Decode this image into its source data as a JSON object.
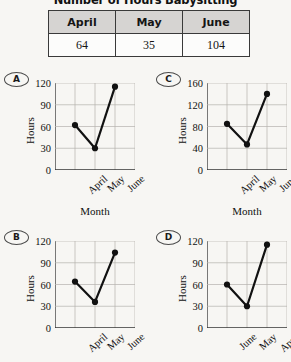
{
  "title": "Number of Hours Babysitting",
  "table": {
    "headers": [
      "April",
      "May",
      "June"
    ],
    "values": [
      "64",
      "35",
      "104"
    ]
  },
  "options": [
    {
      "letter": "A",
      "axis_title": "Month"
    },
    {
      "letter": "C",
      "axis_title": "Month"
    },
    {
      "letter": "B",
      "axis_title": ""
    },
    {
      "letter": "D",
      "axis_title": ""
    }
  ],
  "chart_data": [
    {
      "type": "line",
      "option": "A",
      "title": "",
      "xlabel": "Month",
      "ylabel": "Hours",
      "categories": [
        "April",
        "May",
        "June"
      ],
      "values": [
        62,
        30,
        115
      ],
      "ylim": [
        0,
        120
      ],
      "yticks": [
        0,
        30,
        60,
        90,
        120
      ],
      "grid": true,
      "legend": "none"
    },
    {
      "type": "line",
      "option": "C",
      "title": "",
      "xlabel": "Month",
      "ylabel": "Hours",
      "categories": [
        "April",
        "May",
        "June"
      ],
      "values": [
        85,
        47,
        140
      ],
      "ylim": [
        0,
        160
      ],
      "yticks": [
        0,
        40,
        80,
        120,
        160
      ],
      "grid": true,
      "legend": "none"
    },
    {
      "type": "line",
      "option": "B",
      "title": "",
      "xlabel": "",
      "ylabel": "Hours",
      "categories": [
        "April",
        "May",
        "June"
      ],
      "values": [
        64,
        36,
        104
      ],
      "ylim": [
        0,
        120
      ],
      "yticks": [
        0,
        30,
        60,
        90,
        120
      ],
      "grid": true,
      "legend": "none"
    },
    {
      "type": "line",
      "option": "D",
      "title": "",
      "xlabel": "",
      "ylabel": "Hours",
      "categories": [
        "June",
        "May",
        "April"
      ],
      "values": [
        60,
        30,
        115
      ],
      "ylim": [
        0,
        120
      ],
      "yticks": [
        0,
        30,
        60,
        90,
        120
      ],
      "grid": true,
      "legend": "none"
    }
  ]
}
